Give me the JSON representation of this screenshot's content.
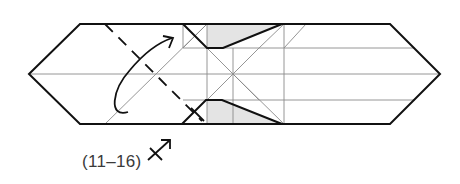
{
  "diagram": {
    "type": "origami-fold-diagram",
    "step_reference_label": "(11–16)",
    "colors": {
      "outline": "#111111",
      "crease": "#8a8a8a",
      "shade": "#e4e4e4",
      "background": "#ffffff"
    },
    "symbols": [
      {
        "name": "valley-fold-dashed-line",
        "meaning": "fold"
      },
      {
        "name": "curved-fold-arrow",
        "meaning": "fold direction"
      },
      {
        "name": "x-ray-arrow-symbol",
        "meaning": "repeat steps reference"
      }
    ]
  }
}
